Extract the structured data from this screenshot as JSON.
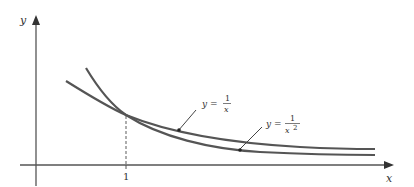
{
  "diagram": {
    "axes": {
      "x_label": "x",
      "y_label": "y",
      "tick_label": "1"
    },
    "curves": [
      {
        "name": "reciprocal",
        "label_lhs": "y =",
        "label_num": "1",
        "label_den": "x"
      },
      {
        "name": "reciprocal-square",
        "label_lhs": "y =",
        "label_num": "1",
        "label_den": "x",
        "label_exp": "2"
      }
    ],
    "colors": {
      "curve": "#555555",
      "axis": "#555555",
      "text": "#333333"
    }
  }
}
